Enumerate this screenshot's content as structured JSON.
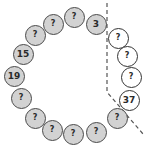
{
  "diagram": {
    "colors": {
      "gray_fill": "#d2d2d2",
      "white_fill": "#ffffff",
      "border": "#4a4a4a",
      "text": "#2a2a2a",
      "dashed_line": "#555555"
    },
    "nodes": [
      {
        "label": "?",
        "x": 74,
        "y": 17,
        "style": "gray"
      },
      {
        "label": "3",
        "x": 96,
        "y": 24,
        "style": "gray"
      },
      {
        "label": "?",
        "x": 118,
        "y": 38,
        "style": "white"
      },
      {
        "label": "?",
        "x": 127,
        "y": 56,
        "style": "white"
      },
      {
        "label": "?",
        "x": 131,
        "y": 77,
        "style": "white"
      },
      {
        "label": "37",
        "x": 129,
        "y": 100,
        "style": "white"
      },
      {
        "label": "?",
        "x": 117,
        "y": 118,
        "style": "gray"
      },
      {
        "label": "?",
        "x": 96,
        "y": 132,
        "style": "gray"
      },
      {
        "label": "?",
        "x": 73,
        "y": 134,
        "style": "gray"
      },
      {
        "label": "?",
        "x": 52,
        "y": 130,
        "style": "gray"
      },
      {
        "label": "?",
        "x": 35,
        "y": 118,
        "style": "gray"
      },
      {
        "label": "?",
        "x": 21,
        "y": 98,
        "style": "gray"
      },
      {
        "label": "19",
        "x": 14,
        "y": 76,
        "style": "gray"
      },
      {
        "label": "15",
        "x": 23,
        "y": 54,
        "style": "gray"
      },
      {
        "label": "?",
        "x": 35,
        "y": 35,
        "style": "gray"
      },
      {
        "label": "?",
        "x": 53,
        "y": 24,
        "style": "gray"
      }
    ],
    "dashed_boundary": {
      "points": [
        [
          107,
          3
        ],
        [
          107,
          92
        ],
        [
          143,
          134
        ]
      ]
    }
  }
}
